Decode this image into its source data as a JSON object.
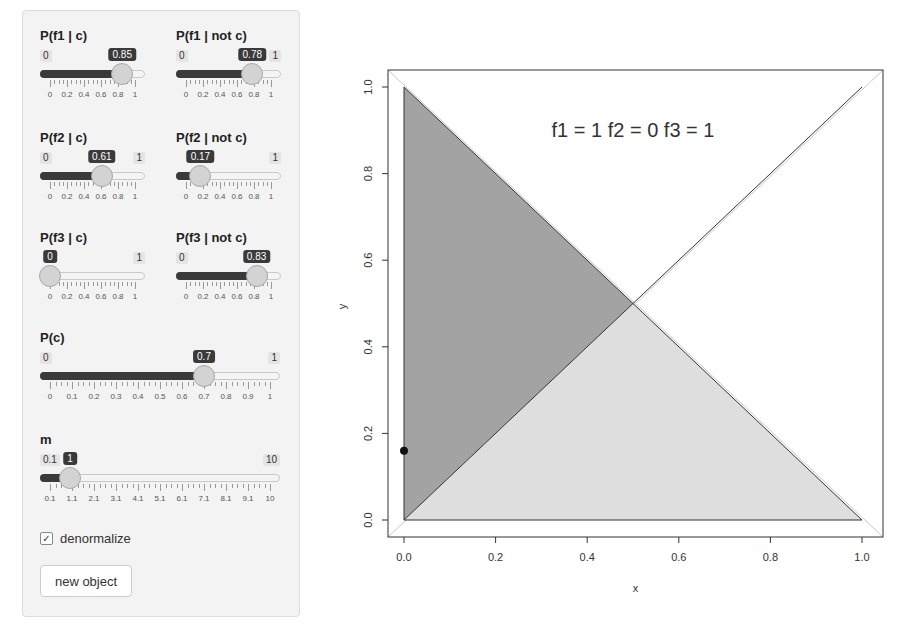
{
  "sidebar": {
    "sliders": [
      {
        "id": "pf1c",
        "label": "P(f1 | c)",
        "min": "0",
        "max": "1",
        "value": "0.85",
        "min_v": 0,
        "max_v": 1,
        "v": 0.85,
        "ticks": [
          "0",
          "0.2",
          "0.4",
          "0.6",
          "0.8",
          "1"
        ],
        "show_max": false
      },
      {
        "id": "pf1nc",
        "label": "P(f1 | not c)",
        "min": "0",
        "max": "1",
        "value": "0.78",
        "min_v": 0,
        "max_v": 1,
        "v": 0.78,
        "ticks": [
          "0",
          "0.2",
          "0.4",
          "0.6",
          "0.8",
          "1"
        ],
        "show_max": true
      },
      {
        "id": "pf2c",
        "label": "P(f2 | c)",
        "min": "0",
        "max": "1",
        "value": "0.61",
        "min_v": 0,
        "max_v": 1,
        "v": 0.61,
        "ticks": [
          "0",
          "0.2",
          "0.4",
          "0.6",
          "0.8",
          "1"
        ],
        "show_max": true
      },
      {
        "id": "pf2nc",
        "label": "P(f2 | not c)",
        "min": "0",
        "max": "1",
        "value": "0.17",
        "min_v": 0,
        "max_v": 1,
        "v": 0.17,
        "ticks": [
          "0",
          "0.2",
          "0.4",
          "0.6",
          "0.8",
          "1"
        ],
        "show_max": true,
        "hide_min": true
      },
      {
        "id": "pf3c",
        "label": "P(f3 | c)",
        "min": "0",
        "max": "1",
        "value": "0",
        "min_v": 0,
        "max_v": 1,
        "v": 0,
        "ticks": [
          "0",
          "0.2",
          "0.4",
          "0.6",
          "0.8",
          "1"
        ],
        "show_max": true,
        "hide_min": true
      },
      {
        "id": "pf3nc",
        "label": "P(f3 | not c)",
        "min": "0",
        "max": "1",
        "value": "0.83",
        "min_v": 0,
        "max_v": 1,
        "v": 0.83,
        "ticks": [
          "0",
          "0.2",
          "0.4",
          "0.6",
          "0.8",
          "1"
        ],
        "show_max": false
      },
      {
        "id": "pc",
        "label": "P(c)",
        "min": "0",
        "max": "1",
        "value": "0.7",
        "min_v": 0,
        "max_v": 1,
        "v": 0.7,
        "ticks": [
          "0",
          "0.1",
          "0.2",
          "0.3",
          "0.4",
          "0.5",
          "0.6",
          "0.7",
          "0.8",
          "0.9",
          "1"
        ],
        "show_max": true
      },
      {
        "id": "m",
        "label": "m",
        "min": "0.1",
        "max": "10",
        "value": "1",
        "min_v": 0.1,
        "max_v": 10,
        "v": 1,
        "ticks": [
          "0.1",
          "1.1",
          "2.1",
          "3.1",
          "4.1",
          "5.1",
          "6.1",
          "7.1",
          "8.1",
          "9.1",
          "10"
        ],
        "show_max": true
      }
    ],
    "denormalize": {
      "label": "denormalize",
      "checked": true,
      "check_glyph": "✓"
    },
    "new_object_button": {
      "label": "new object"
    }
  },
  "plot": {
    "title": "f1 = 1 f2 = 0 f3 = 1",
    "xlabel": "x",
    "ylabel": "y",
    "xticks": [
      "0.0",
      "0.2",
      "0.4",
      "0.6",
      "0.8",
      "1.0"
    ],
    "yticks": [
      "0.0",
      "0.2",
      "0.4",
      "0.6",
      "0.8",
      "1.0"
    ],
    "colors": {
      "dark_region": "#a3a3a3",
      "light_region": "#dedede",
      "lines": "#333333",
      "point": "#111111"
    }
  },
  "chart_data": {
    "type": "scatter",
    "title": "f1 = 1 f2 = 0 f3 = 1",
    "xlabel": "x",
    "ylabel": "y",
    "xlim": [
      0,
      1
    ],
    "ylim": [
      0,
      1
    ],
    "grid": false,
    "regions": [
      {
        "name": "dark triangle",
        "vertices": [
          [
            0,
            0
          ],
          [
            0,
            1
          ],
          [
            0.5,
            0.5
          ]
        ],
        "fill": "#a3a3a3"
      },
      {
        "name": "light triangle",
        "vertices": [
          [
            0,
            0
          ],
          [
            1,
            0
          ],
          [
            0.5,
            0.5
          ]
        ],
        "fill": "#dedede"
      }
    ],
    "lines": [
      {
        "from": [
          0,
          0
        ],
        "to": [
          1,
          1
        ]
      },
      {
        "from": [
          0,
          1
        ],
        "to": [
          1,
          0
        ]
      },
      {
        "from": [
          0,
          0
        ],
        "to": [
          0,
          1
        ]
      },
      {
        "from": [
          0,
          0
        ],
        "to": [
          1,
          0
        ]
      }
    ],
    "points": [
      {
        "x": 0.0,
        "y": 0.16
      }
    ]
  }
}
